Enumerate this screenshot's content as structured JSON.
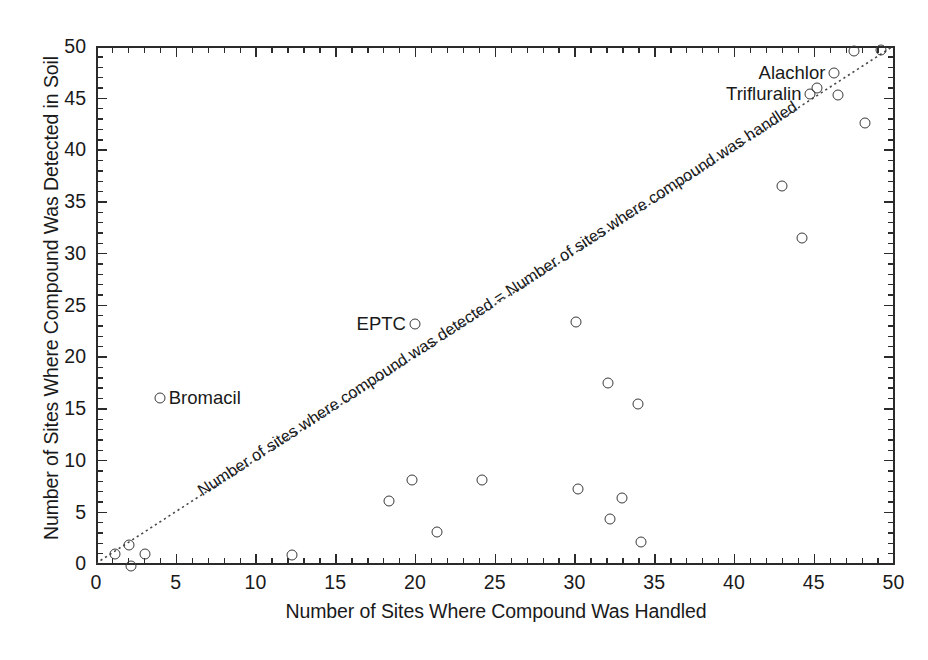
{
  "chart_data": {
    "type": "scatter",
    "title": "",
    "xlabel": "Number of Sites Where Compound Was Handled",
    "ylabel": "Number of Sites Where Compound Was Detected in Soil",
    "xlim": [
      0,
      50
    ],
    "ylim": [
      0,
      50
    ],
    "xticks": [
      0,
      5,
      10,
      15,
      20,
      25,
      30,
      35,
      40,
      45,
      50
    ],
    "yticks": [
      0,
      5,
      10,
      15,
      20,
      25,
      30,
      35,
      40,
      45,
      50
    ],
    "xtick_labels": [
      "0",
      "5",
      "10",
      "15",
      "20",
      "25",
      "30",
      "35",
      "40",
      "45",
      "50"
    ],
    "ytick_labels": [
      "0",
      "5",
      "10",
      "15",
      "20",
      "25",
      "30",
      "35",
      "40",
      "45",
      "50"
    ],
    "minor_tick_interval": 1,
    "grid": false,
    "legend": null,
    "marker": "open-circle",
    "points": [
      {
        "x": 1.2,
        "y": 0.9,
        "label": null
      },
      {
        "x": 2.1,
        "y": 1.8,
        "label": null
      },
      {
        "x": 2.2,
        "y": -0.25,
        "label": null
      },
      {
        "x": 3.1,
        "y": 0.9,
        "label": null
      },
      {
        "x": 4.0,
        "y": 16.0,
        "label": "Bromacil",
        "label_side": "right"
      },
      {
        "x": 12.3,
        "y": 0.8,
        "label": null
      },
      {
        "x": 18.4,
        "y": 6.0,
        "label": null
      },
      {
        "x": 19.8,
        "y": 8.1,
        "label": null
      },
      {
        "x": 20.0,
        "y": 23.1,
        "label": "EPTC",
        "label_side": "left"
      },
      {
        "x": 21.4,
        "y": 3.0,
        "label": null
      },
      {
        "x": 24.2,
        "y": 8.1,
        "label": null
      },
      {
        "x": 30.1,
        "y": 23.3,
        "label": null
      },
      {
        "x": 30.2,
        "y": 7.2,
        "label": null
      },
      {
        "x": 32.1,
        "y": 17.4,
        "label": null
      },
      {
        "x": 32.2,
        "y": 4.3,
        "label": null
      },
      {
        "x": 33.0,
        "y": 6.3,
        "label": null
      },
      {
        "x": 34.0,
        "y": 15.4,
        "label": null
      },
      {
        "x": 34.2,
        "y": 2.1,
        "label": null
      },
      {
        "x": 43.0,
        "y": 36.5,
        "label": null
      },
      {
        "x": 44.3,
        "y": 31.4,
        "label": null
      },
      {
        "x": 44.8,
        "y": 45.4,
        "label": "Trifluralin",
        "label_side": "left"
      },
      {
        "x": 45.2,
        "y": 45.9,
        "label": null
      },
      {
        "x": 46.3,
        "y": 47.4,
        "label": "Alachlor",
        "label_side": "left"
      },
      {
        "x": 46.5,
        "y": 45.3,
        "label": null
      },
      {
        "x": 47.5,
        "y": 49.5,
        "label": null
      },
      {
        "x": 48.2,
        "y": 42.6,
        "label": null
      },
      {
        "x": 49.2,
        "y": 49.6,
        "label": null
      }
    ],
    "reference_line": {
      "type": "identity",
      "style": "dotted",
      "from": [
        0,
        0
      ],
      "to": [
        50,
        50
      ],
      "annotation": "Number of sites where compound was detected = Number of sites where compound was handled"
    }
  },
  "annotations": {
    "bromacil": "Bromacil",
    "eptc": "EPTC",
    "alachlor": "Alachlor",
    "trifluralin": "Trifluralin",
    "identity_line_text": "Number of sites where compound was detected = Number of sites where compound was handled"
  },
  "colors": {
    "axis": "#2b2b2b",
    "marker_stroke": "#3a3a3a",
    "text": "#1a1a1a",
    "background": "#ffffff",
    "reference_line": "#4a4a4a"
  }
}
